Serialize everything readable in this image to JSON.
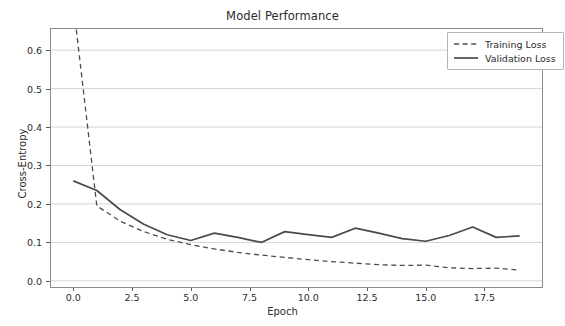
{
  "chart_data": {
    "type": "line",
    "title": "Model Performance",
    "xlabel": "Epoch",
    "ylabel": "Cross-Entropy",
    "xlim": [
      -0.95,
      19.95
    ],
    "ylim": [
      -0.016,
      0.655
    ],
    "xticks": [
      "0.0",
      "2.5",
      "5.0",
      "7.5",
      "10.0",
      "12.5",
      "15.0",
      "17.5"
    ],
    "xtick_values": [
      0.0,
      2.5,
      5.0,
      7.5,
      10.0,
      12.5,
      15.0,
      17.5
    ],
    "yticks": [
      "0.0",
      "0.1",
      "0.2",
      "0.3",
      "0.4",
      "0.5",
      "0.6"
    ],
    "ytick_values": [
      0.0,
      0.1,
      0.2,
      0.3,
      0.4,
      0.5,
      0.6
    ],
    "grid": true,
    "grid_axis": "y",
    "legend_position": "upper right",
    "x": [
      0,
      1,
      2,
      3,
      4,
      5,
      6,
      7,
      8,
      9,
      10,
      11,
      12,
      13,
      14,
      15,
      16,
      17,
      18,
      19
    ],
    "series": [
      {
        "name": "Training Loss",
        "style": "dashed",
        "color": "#4d4d4d",
        "values": [
          0.72,
          0.195,
          0.155,
          0.128,
          0.108,
          0.094,
          0.083,
          0.074,
          0.067,
          0.061,
          0.055,
          0.05,
          0.046,
          0.042,
          0.04,
          0.041,
          0.034,
          0.032,
          0.033,
          0.028
        ]
      },
      {
        "name": "Validation Loss",
        "style": "solid",
        "color": "#4a4a4a",
        "values": [
          0.26,
          0.235,
          0.185,
          0.147,
          0.12,
          0.105,
          0.124,
          0.113,
          0.1,
          0.128,
          0.12,
          0.113,
          0.137,
          0.124,
          0.11,
          0.103,
          0.118,
          0.14,
          0.113,
          0.117
        ]
      }
    ]
  },
  "legend": {
    "entries": [
      {
        "label": "Training Loss"
      },
      {
        "label": "Validation Loss"
      }
    ]
  },
  "style": {
    "axis_color": "#8a8a8a",
    "grid_color": "#d4d4d4",
    "text_color": "#2b2b2b",
    "background": "#ffffff"
  }
}
